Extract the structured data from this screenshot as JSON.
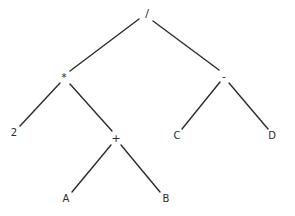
{
  "diagram": {
    "background_color": "#ffffff",
    "line_color": "#2b2b2b",
    "text_color": "#2b2b2b",
    "expression": "2 * (A + B) / (C - D)",
    "nodes": [
      {
        "id": "root",
        "label": "/",
        "kind": "operator",
        "x": 147,
        "y": 13
      },
      {
        "id": "mul",
        "label": "*",
        "kind": "operator",
        "x": 64,
        "y": 77
      },
      {
        "id": "minus",
        "label": "-",
        "kind": "operator",
        "x": 224,
        "y": 76
      },
      {
        "id": "two",
        "label": "2",
        "kind": "operand",
        "x": 14,
        "y": 133
      },
      {
        "id": "plus",
        "label": "+",
        "kind": "operator",
        "x": 116,
        "y": 138
      },
      {
        "id": "c",
        "label": "C",
        "kind": "operand",
        "x": 177,
        "y": 136
      },
      {
        "id": "d",
        "label": "D",
        "kind": "operand",
        "x": 272,
        "y": 136
      },
      {
        "id": "a",
        "label": "A",
        "kind": "operand",
        "x": 66,
        "y": 199
      },
      {
        "id": "b",
        "label": "B",
        "kind": "operand",
        "x": 166,
        "y": 199
      }
    ],
    "edges": [
      {
        "id": "root-mul",
        "from": "root",
        "to": "mul",
        "x1": 139,
        "y1": 19,
        "x2": 70,
        "y2": 71
      },
      {
        "id": "root-minus",
        "from": "root",
        "to": "minus",
        "x1": 153,
        "y1": 21,
        "x2": 219,
        "y2": 70
      },
      {
        "id": "mul-two",
        "from": "mul",
        "to": "two",
        "x1": 60,
        "y1": 83,
        "x2": 20,
        "y2": 126
      },
      {
        "id": "mul-plus",
        "from": "mul",
        "to": "plus",
        "x1": 70,
        "y1": 84,
        "x2": 112,
        "y2": 131
      },
      {
        "id": "minus-c",
        "from": "minus",
        "to": "c",
        "x1": 220,
        "y1": 82,
        "x2": 182,
        "y2": 129
      },
      {
        "id": "minus-d",
        "from": "minus",
        "to": "d",
        "x1": 229,
        "y1": 83,
        "x2": 268,
        "y2": 129
      },
      {
        "id": "plus-a",
        "from": "plus",
        "to": "a",
        "x1": 111,
        "y1": 145,
        "x2": 72,
        "y2": 192
      },
      {
        "id": "plus-b",
        "from": "plus",
        "to": "b",
        "x1": 121,
        "y1": 145,
        "x2": 160,
        "y2": 192
      }
    ]
  }
}
